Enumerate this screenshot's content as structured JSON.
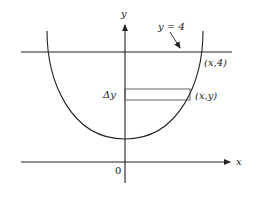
{
  "diagram": {
    "type": "calculus-cross-section",
    "labels": {
      "y_axis": "y",
      "x_axis": "x",
      "origin": "0",
      "line_label": "y = 4",
      "top_point": "(x,4)",
      "strip_point": "(x,y)",
      "delta": "Δy"
    },
    "colors": {
      "stroke": "#222222",
      "strip": "#555555",
      "background": "#ffffff"
    }
  }
}
